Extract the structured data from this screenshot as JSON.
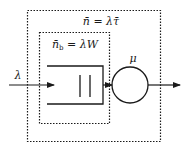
{
  "diagram": {
    "type": "queueing-system",
    "outer_box": {
      "label": "n̄ = λτ̄",
      "style": "dotted"
    },
    "inner_box": {
      "label_main": "n̄",
      "label_sub": "b",
      "label_rest": " = λW",
      "style": "dotted"
    },
    "input": {
      "label": "λ"
    },
    "server": {
      "label": "μ"
    },
    "colors": {
      "line": "#1a1a1a",
      "background": "#ffffff"
    }
  }
}
